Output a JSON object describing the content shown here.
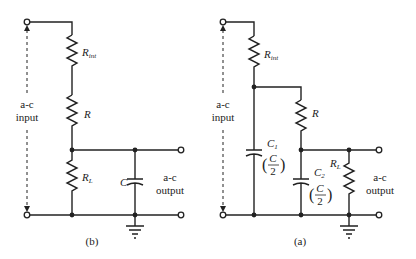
{
  "diagrams": [
    {
      "id": "b",
      "caption": "(b)",
      "input_label": [
        "a-c",
        "input"
      ],
      "output_label": [
        "a-c",
        "output"
      ],
      "components": {
        "r_int": {
          "name": "R",
          "sub": "int"
        },
        "r": {
          "name": "R"
        },
        "r_load": {
          "name": "R",
          "sub": "L"
        },
        "c": {
          "name": "C"
        }
      }
    },
    {
      "id": "a",
      "caption": "(a)",
      "input_label": [
        "a-c",
        "input"
      ],
      "output_label": [
        "a-c",
        "output"
      ],
      "components": {
        "r_int": {
          "name": "R",
          "sub": "int"
        },
        "r": {
          "name": "R"
        },
        "r_load": {
          "name": "R",
          "sub": "L"
        },
        "c1": {
          "name": "C",
          "sub": "1",
          "value_num": "C",
          "value_den": "2"
        },
        "c2": {
          "name": "C",
          "sub": "2",
          "value_num": "C",
          "value_den": "2"
        }
      }
    }
  ],
  "colors": {
    "ink": "#222222",
    "background": "#ffffff"
  }
}
